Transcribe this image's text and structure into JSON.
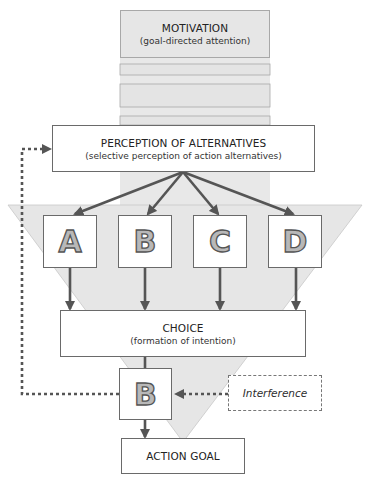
{
  "diagram": {
    "motivation": {
      "title": "MOTIVATION",
      "subtitle": "(goal-directed attention)"
    },
    "perception": {
      "title": "PERCEPTION OF ALTERNATIVES",
      "subtitle": "(selective perception of action alternatives)"
    },
    "alternatives": [
      {
        "label": "A"
      },
      {
        "label": "B"
      },
      {
        "label": "C"
      },
      {
        "label": "D"
      }
    ],
    "choice": {
      "title": "CHOICE",
      "subtitle": "(formation of intention)"
    },
    "selected_alternative": {
      "label": "B"
    },
    "interference": {
      "label": "Interference"
    },
    "action_goal": {
      "title": "ACTION GOAL"
    },
    "colors": {
      "funnel_fill": "#e6e6e6",
      "arrow": "#555555",
      "box_border": "#6a6a6a"
    }
  }
}
